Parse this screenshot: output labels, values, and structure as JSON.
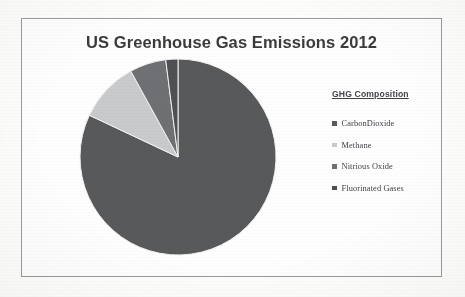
{
  "document": {
    "background_color": "#fdfdfc",
    "frame_border_color": "#9a9a98"
  },
  "chart_title": "US Greenhouse Gas Emissions 2012",
  "legend": {
    "title": "GHG Composition",
    "items": [
      {
        "label": "CarbonDioxide",
        "color": "#58595b"
      },
      {
        "label": "Methane",
        "color": "#c8cacb"
      },
      {
        "label": "Nitrious Oxide",
        "color": "#6e7073"
      },
      {
        "label": "Fluorinated Gases",
        "color": "#4f5053"
      }
    ]
  },
  "chart_data": {
    "type": "pie",
    "title": "US Greenhouse Gas Emissions 2012",
    "legend_title": "GHG Composition",
    "legend_position": "right",
    "start_angle_deg": 0,
    "direction": "clockwise",
    "labels": [
      "CarbonDioxide",
      "Methane",
      "Nitrious Oxide",
      "Fluorinated Gases"
    ],
    "values": [
      82,
      10,
      6,
      2
    ],
    "units": "percent",
    "colors": [
      "#58595b",
      "#c8cacb",
      "#6e7073",
      "#4f5053"
    ],
    "slices": [
      {
        "label": "CarbonDioxide",
        "value": 82,
        "color": "#58595b",
        "start_deg": 0,
        "end_deg": 295.2
      },
      {
        "label": "Methane",
        "value": 10,
        "color": "#c8cacb",
        "start_deg": 295.2,
        "end_deg": 331.2
      },
      {
        "label": "Nitrious Oxide",
        "value": 6,
        "color": "#6e7073",
        "start_deg": 331.2,
        "end_deg": 352.8
      },
      {
        "label": "Fluorinated Gases",
        "value": 2,
        "color": "#4f5053",
        "start_deg": 352.8,
        "end_deg": 360
      }
    ],
    "geometry": {
      "center_x": 100,
      "center_y": 101,
      "radius": 98
    },
    "data_labels_shown": false,
    "grid": false
  }
}
